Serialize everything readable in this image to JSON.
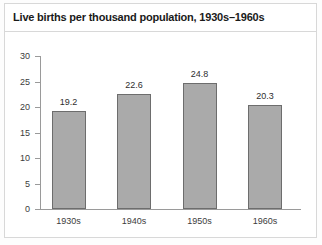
{
  "chart_data": {
    "type": "bar",
    "title": "Live births per thousand population, 1930s–1960s",
    "categories": [
      "1930s",
      "1940s",
      "1950s",
      "1960s"
    ],
    "values": [
      19.2,
      22.6,
      24.8,
      20.3
    ],
    "value_labels": [
      "19.2",
      "22.6",
      "24.8",
      "20.3"
    ],
    "xlabel": "",
    "ylabel": "",
    "ylim": [
      0,
      30
    ],
    "yticks": [
      0,
      5,
      10,
      15,
      20,
      25,
      30
    ],
    "ytick_labels": [
      "0",
      "5",
      "10",
      "15",
      "20",
      "25",
      "30"
    ],
    "grid": false,
    "legend": false,
    "bar_color": "#aaaaaa",
    "bar_edge_color": "#6d6d6d",
    "axis_color": "#9a9a9a",
    "text_color": "#3c3c3c",
    "title_color": "#1a1a1a",
    "background_color": "#ffffff",
    "border_color": "#d8d8d8"
  }
}
